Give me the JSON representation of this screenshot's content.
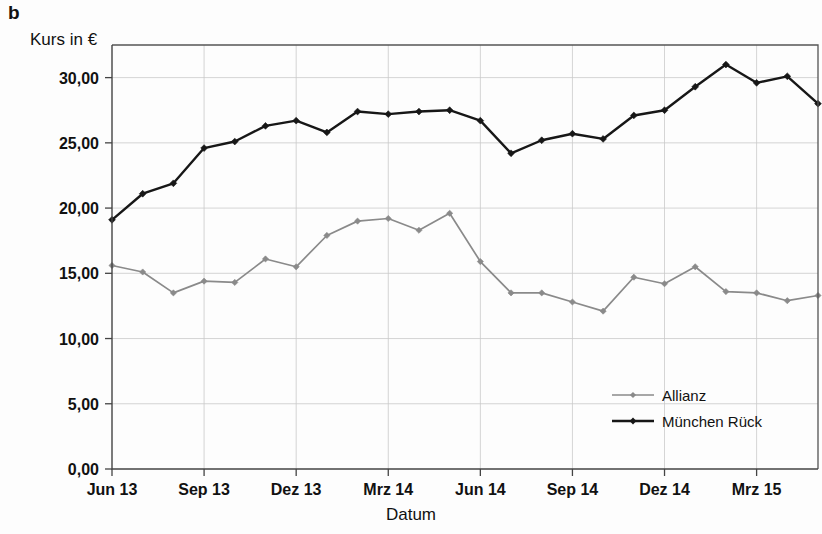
{
  "panel": {
    "letter": "b"
  },
  "chart_data": {
    "type": "line",
    "title": "",
    "ylabel": "Kurs in €",
    "xlabel": "Datum",
    "ylim": [
      0,
      32.5
    ],
    "yticks": [
      0,
      5,
      10,
      15,
      20,
      25,
      30
    ],
    "ytick_labels": [
      "0,00",
      "5,00",
      "10,00",
      "15,00",
      "20,00",
      "25,00",
      "30,00"
    ],
    "grid": true,
    "legend_position": "inside-bottom-right",
    "x": [
      "Jun 13",
      "Jul 13",
      "Aug 13",
      "Sep 13",
      "Okt 13",
      "Nov 13",
      "Dez 13",
      "Jan 14",
      "Feb 14",
      "Mrz 14",
      "Apr 14",
      "Mai 14",
      "Jun 14",
      "Jul 14",
      "Aug 14",
      "Sep 14",
      "Okt 14",
      "Nov 14",
      "Dez 14",
      "Jan 15",
      "Feb 15",
      "Mrz 15",
      "Apr 15",
      "Mai 15"
    ],
    "xticks": [
      "Jun 13",
      "Sep 13",
      "Dez 13",
      "Mrz 14",
      "Jun 14",
      "Sep 14",
      "Dez 14",
      "Mrz 15"
    ],
    "xtick_indices": [
      0,
      3,
      6,
      9,
      12,
      15,
      18,
      21
    ],
    "series": [
      {
        "name": "Allianz",
        "color": "#8a8a8a",
        "marker": "diamond",
        "values": [
          15.6,
          15.1,
          13.5,
          14.4,
          14.3,
          16.1,
          15.5,
          17.9,
          19.0,
          19.2,
          18.3,
          19.6,
          15.9,
          13.5,
          13.5,
          12.8,
          12.1,
          14.7,
          14.2,
          15.5,
          13.6,
          13.5,
          12.9,
          13.3
        ]
      },
      {
        "name": "München Rück",
        "color": "#171717",
        "marker": "diamond",
        "values": [
          19.1,
          21.1,
          21.9,
          24.6,
          25.1,
          26.3,
          26.7,
          25.8,
          27.4,
          27.2,
          27.4,
          27.5,
          26.7,
          24.2,
          25.2,
          25.7,
          25.3,
          27.1,
          27.5,
          29.3,
          31.0,
          29.6,
          30.1,
          28.0
        ]
      }
    ]
  },
  "legend": {
    "entries": [
      {
        "label": "Allianz"
      },
      {
        "label": "München Rück"
      }
    ]
  }
}
